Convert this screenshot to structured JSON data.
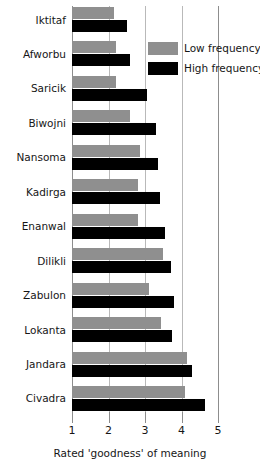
{
  "chart_data": {
    "type": "bar",
    "orientation": "horizontal",
    "title": "",
    "xlabel": "Rated 'goodness' of meaning",
    "ylabel": "",
    "xlim": [
      1,
      5
    ],
    "xticks": [
      "1",
      "2",
      "3",
      "4",
      "5"
    ],
    "gridlines": [
      2,
      3,
      4
    ],
    "grid": true,
    "legend_position": "top-right",
    "categories": [
      "Iktitaf",
      "Afworbu",
      "Saricik",
      "Biwojni",
      "Nansoma",
      "Kadirga",
      "Enanwal",
      "Dilikli",
      "Zabulon",
      "Lokanta",
      "Jandara",
      "Civadra"
    ],
    "series": [
      {
        "name": "Low frequency",
        "color": "#8f8f8f",
        "values": [
          2.15,
          2.2,
          2.2,
          2.6,
          2.85,
          2.8,
          2.8,
          3.5,
          3.1,
          3.45,
          4.15,
          4.1
        ]
      },
      {
        "name": "High frequency",
        "color": "#000000",
        "values": [
          2.5,
          2.6,
          3.05,
          3.3,
          3.35,
          3.4,
          3.55,
          3.7,
          3.8,
          3.75,
          4.3,
          4.65
        ]
      }
    ]
  },
  "legend": {
    "items": [
      {
        "label": "Low frequency",
        "color": "#8f8f8f"
      },
      {
        "label": "High frequency",
        "color": "#000000"
      }
    ]
  },
  "axis": {
    "x_title": "Rated 'goodness' of meaning",
    "ticks": [
      "1",
      "2",
      "3",
      "4",
      "5"
    ]
  }
}
